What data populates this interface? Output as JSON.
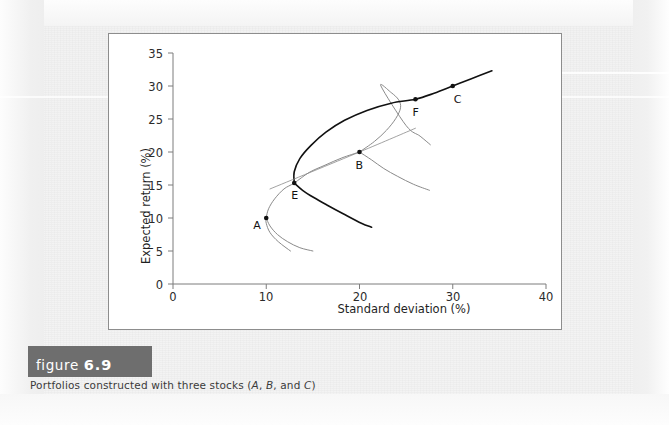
{
  "figure": {
    "banner_word": "figure",
    "banner_number": "6.9",
    "caption_prefix": "Portfolios constructed with three stocks (",
    "caption_a": "A",
    "caption_sep1": ", ",
    "caption_b": "B",
    "caption_sep2": ", and ",
    "caption_c": "C",
    "caption_suffix": ")",
    "banner_color": "#6e6e6e",
    "panel_bg": "#ffffff",
    "page_bg": "#f2f2f2"
  },
  "chart_data": {
    "type": "line",
    "title": "",
    "xlabel": "Standard deviation (%)",
    "ylabel": "Expected return (%)",
    "xlim": [
      0,
      40
    ],
    "ylim": [
      0,
      35
    ],
    "xticks": [
      0,
      10,
      20,
      30,
      40
    ],
    "yticks": [
      0,
      5,
      10,
      15,
      20,
      25,
      30,
      35
    ],
    "grid": false,
    "legend": "none",
    "colors": {
      "efficient_frontier": "#111111",
      "two_asset_curve": "#8a8a8a"
    },
    "annotations": [
      {
        "label": "A",
        "x": 10.0,
        "y": 10.0,
        "note": "stock A"
      },
      {
        "label": "E",
        "x": 13.0,
        "y": 15.3,
        "note": "portfolio E on curve A-B"
      },
      {
        "label": "B",
        "x": 20.0,
        "y": 20.0,
        "note": "stock B"
      },
      {
        "label": "F",
        "x": 26.0,
        "y": 28.0,
        "note": "portfolio F on curve E-C"
      },
      {
        "label": "C",
        "x": 30.0,
        "y": 30.0,
        "note": "stock C"
      }
    ],
    "series": [
      {
        "name": "Curve A-B (two-stock portfolios of A and B)",
        "color": "#8a8a8a",
        "points": [
          [
            12.6,
            5.0
          ],
          [
            11.3,
            6.4
          ],
          [
            10.4,
            7.8
          ],
          [
            10.0,
            9.2
          ],
          [
            10.0,
            10.0
          ],
          [
            10.25,
            11.4
          ],
          [
            10.9,
            12.9
          ],
          [
            11.9,
            14.4
          ],
          [
            13.0,
            15.3
          ],
          [
            14.6,
            16.9
          ],
          [
            16.3,
            18.0
          ],
          [
            18.1,
            19.1
          ],
          [
            20.0,
            20.0
          ]
        ]
      },
      {
        "name": "Curve B-C (two-stock portfolios of B and C)",
        "color": "#8a8a8a",
        "points": [
          [
            20.0,
            20.0
          ],
          [
            21.6,
            21.6
          ],
          [
            22.9,
            23.3
          ],
          [
            23.9,
            25.1
          ],
          [
            24.4,
            26.7
          ],
          [
            24.2,
            27.9
          ],
          [
            23.4,
            29.0
          ],
          [
            22.3,
            30.0
          ],
          [
            25.0,
            24.0
          ],
          [
            26.5,
            22.4
          ],
          [
            27.6,
            21.1
          ]
        ]
      },
      {
        "name": "Curve E-C (efficient frontier with three stocks)",
        "color": "#111111",
        "points": [
          [
            13.0,
            15.3
          ],
          [
            13.0,
            17.0
          ],
          [
            13.6,
            19.0
          ],
          [
            14.8,
            21.0
          ],
          [
            16.4,
            23.0
          ],
          [
            18.4,
            24.8
          ],
          [
            20.8,
            26.3
          ],
          [
            23.4,
            27.4
          ],
          [
            26.0,
            28.0
          ],
          [
            28.0,
            28.9
          ],
          [
            30.0,
            30.0
          ],
          [
            32.0,
            31.1
          ],
          [
            34.2,
            32.3
          ]
        ]
      },
      {
        "name": "Lower branch from E (inefficient portfolios)",
        "color": "#111111",
        "points": [
          [
            13.0,
            15.3
          ],
          [
            13.9,
            14.2
          ],
          [
            15.1,
            13.1
          ],
          [
            16.6,
            11.9
          ],
          [
            18.3,
            10.6
          ],
          [
            20.2,
            9.2
          ],
          [
            21.3,
            8.6
          ]
        ]
      },
      {
        "name": "Lower branch from B (inefficient portfolios B-C)",
        "color": "#8a8a8a",
        "points": [
          [
            20.0,
            20.0
          ],
          [
            21.3,
            18.8
          ],
          [
            22.6,
            17.5
          ],
          [
            24.1,
            16.3
          ],
          [
            25.8,
            15.1
          ],
          [
            27.5,
            14.2
          ]
        ]
      },
      {
        "name": "Lower branch from A (inefficient portfolios A-B)",
        "color": "#8a8a8a",
        "points": [
          [
            10.0,
            10.0
          ],
          [
            10.4,
            8.8
          ],
          [
            11.2,
            7.5
          ],
          [
            12.3,
            6.4
          ],
          [
            13.6,
            5.5
          ],
          [
            15.0,
            5.0
          ]
        ]
      },
      {
        "name": "Tangent ray through B",
        "color": "#8a8a8a",
        "points": [
          [
            10.4,
            14.4
          ],
          [
            20.0,
            20.0
          ],
          [
            26.0,
            23.6
          ]
        ]
      }
    ]
  }
}
